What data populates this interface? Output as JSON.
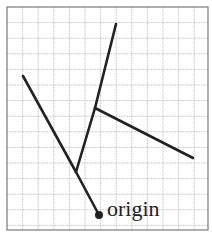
{
  "diagram": {
    "frame": {
      "x": 7,
      "y": 7,
      "width": 201,
      "height": 223,
      "stroke": "#7a7a7a"
    },
    "grid": {
      "spacing": 15.6,
      "color": "#b8b8b8"
    },
    "origin": {
      "x": 99,
      "y": 215,
      "label": "origin"
    },
    "segments": [
      {
        "name": "trunk-lower",
        "x1": 99,
        "y1": 215,
        "x2": 76,
        "y2": 172
      },
      {
        "name": "left-branch",
        "x1": 76,
        "y1": 172,
        "x2": 23,
        "y2": 76
      },
      {
        "name": "trunk-middle",
        "x1": 76,
        "y1": 172,
        "x2": 95,
        "y2": 108
      },
      {
        "name": "trunk-upper",
        "x1": 95,
        "y1": 108,
        "x2": 116,
        "y2": 24
      },
      {
        "name": "right-branch",
        "x1": 95,
        "y1": 108,
        "x2": 193,
        "y2": 158
      }
    ],
    "line_color": "#222222"
  }
}
